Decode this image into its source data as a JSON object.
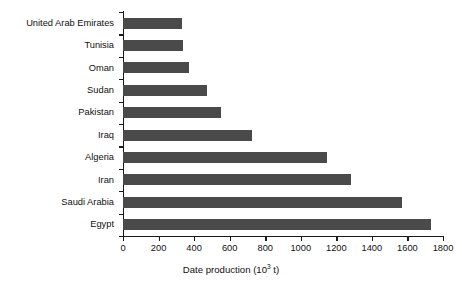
{
  "chart_data": {
    "type": "bar",
    "orientation": "horizontal",
    "title": "",
    "xlabel": "Date production (10^3 t)",
    "xlabel_prefix": "Date production (10",
    "xlabel_sup": "3",
    "xlabel_suffix": " t)",
    "ylabel": "",
    "categories": [
      "United Arab Emirates",
      "Tunisia",
      "Oman",
      "Sudan",
      "Pakistan",
      "Iraq",
      "Algeria",
      "Iran",
      "Saudi Arabia",
      "Egypt"
    ],
    "values": [
      330,
      340,
      370,
      470,
      550,
      725,
      1145,
      1285,
      1570,
      1730
    ],
    "xlim": [
      0,
      1800
    ],
    "xticks": [
      0,
      200,
      400,
      600,
      800,
      1000,
      1200,
      1400,
      1600,
      1800
    ],
    "xtick_labels": [
      "0",
      "200",
      "400",
      "600",
      "800",
      "1000",
      "1200",
      "1400",
      "1600",
      "1800"
    ],
    "grid": false,
    "legend": false,
    "bar_color": "#4a4a4a",
    "axis_color": "#1a1a1a",
    "background_color": "#ffffff"
  }
}
